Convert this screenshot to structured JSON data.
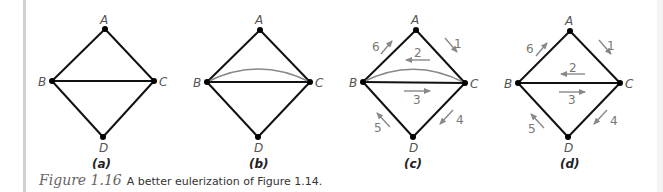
{
  "figure": {
    "number": "Figure 1.16",
    "caption": "A better eulerization of Figure 1.14.",
    "colors": {
      "edge": "#111111",
      "added_edge": "#888888",
      "arrow": "#888888",
      "vertex": "#000000"
    },
    "panels": [
      {
        "label": "(a)",
        "vertices": {
          "A": "A",
          "B": "B",
          "C": "C",
          "D": "D"
        },
        "edges": [
          "AB",
          "AC",
          "BC",
          "BD",
          "CD"
        ],
        "added_edges": []
      },
      {
        "label": "(b)",
        "vertices": {
          "A": "A",
          "B": "B",
          "C": "C",
          "D": "D"
        },
        "edges": [
          "AB",
          "AC",
          "BC",
          "BD",
          "CD"
        ],
        "added_edges": [
          "BC (curved)"
        ]
      },
      {
        "label": "(c)",
        "vertices": {
          "A": "A",
          "B": "B",
          "C": "C",
          "D": "D"
        },
        "edges": [
          "AB",
          "AC",
          "BC",
          "BD",
          "CD"
        ],
        "added_edges": [
          "BC (curved)"
        ],
        "route": [
          {
            "step": "1",
            "from": "A",
            "to": "C"
          },
          {
            "step": "2",
            "from": "C",
            "to": "B"
          },
          {
            "step": "3",
            "from": "B",
            "to": "C"
          },
          {
            "step": "4",
            "from": "C",
            "to": "D"
          },
          {
            "step": "5",
            "from": "D",
            "to": "B"
          },
          {
            "step": "6",
            "from": "B",
            "to": "A"
          }
        ]
      },
      {
        "label": "(d)",
        "vertices": {
          "A": "A",
          "B": "B",
          "C": "C",
          "D": "D"
        },
        "edges": [
          "AB",
          "AC",
          "BC",
          "BD",
          "CD"
        ],
        "added_edges": [],
        "route": [
          {
            "step": "1",
            "from": "A",
            "to": "C"
          },
          {
            "step": "2",
            "from": "C",
            "to": "B"
          },
          {
            "step": "3",
            "from": "B",
            "to": "C"
          },
          {
            "step": "4",
            "from": "C",
            "to": "D"
          },
          {
            "step": "5",
            "from": "D",
            "to": "B"
          },
          {
            "step": "6",
            "from": "B",
            "to": "A"
          }
        ]
      }
    ]
  }
}
